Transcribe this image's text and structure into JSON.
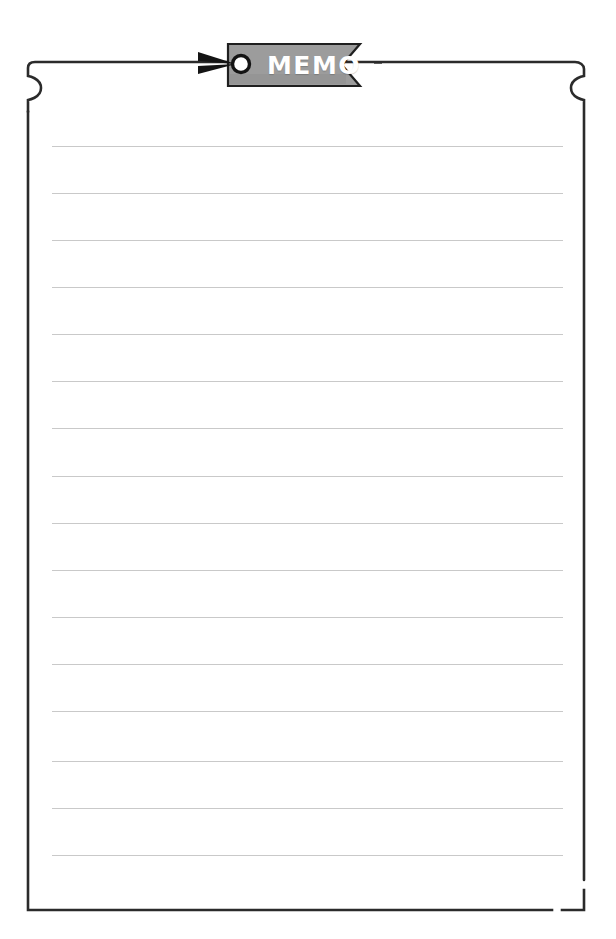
{
  "document": {
    "type": "memo-notepad-page",
    "title": "MEMO",
    "paper": {
      "background_color": "#ffffff",
      "border_color": "#2b2b2b",
      "corner_style": "curled-notch-top-scissor-cut-bottom-right"
    }
  },
  "tag": {
    "label": "MEMO",
    "fill_color": "#9c9c9c",
    "border_color": "#1f1f1f",
    "text_color": "#ffffff",
    "eyelet_icon": "ring-eyelet-icon",
    "pointer_icon": "arrowhead-pin-icon",
    "notch_side": "right"
  },
  "lines": {
    "color": "#c9c9c9",
    "count": 16,
    "spacing_px": 47,
    "first_y": 146,
    "left_x": 52,
    "width": 511,
    "positions": [
      146,
      193,
      240,
      287,
      334,
      381,
      428,
      476,
      523,
      570,
      617,
      664,
      711,
      761,
      808,
      855
    ]
  }
}
